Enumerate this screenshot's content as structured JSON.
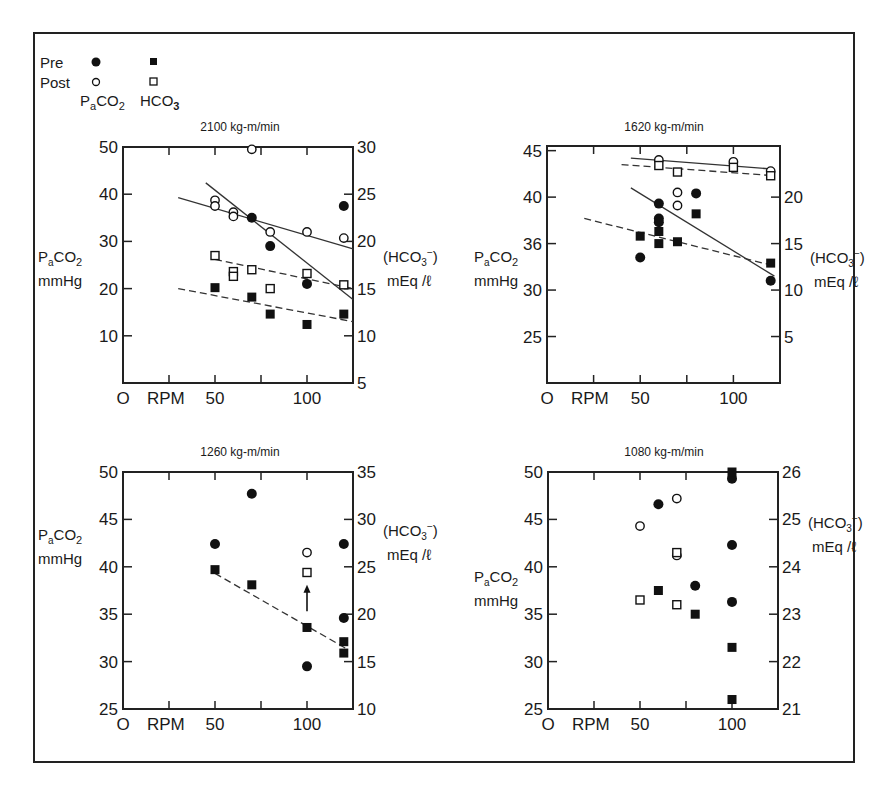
{
  "legend": {
    "rows": [
      {
        "label": "Pre",
        "paco2_marker": "filled-circle",
        "hco3_marker": "filled-square"
      },
      {
        "label": "Post",
        "paco2_marker": "open-circle",
        "hco3_marker": "open-square"
      }
    ],
    "paco2_label": "PaCO2",
    "hco3_label": "HCO3"
  },
  "chart_data": [
    {
      "type": "scatter",
      "title": "2100 kg-m/min",
      "xlabel": "RPM",
      "x_origin_label": "O",
      "x_ticks": [
        0,
        25,
        50,
        75,
        100
      ],
      "x_tick_labels": [
        "",
        "",
        "50",
        "",
        "100"
      ],
      "xlim": [
        0,
        125
      ],
      "ylabel_left": "PaCO2 mmHg",
      "ylim_left": [
        0,
        50
      ],
      "y_ticks_left": [
        50,
        40,
        30,
        20,
        10
      ],
      "ylabel_right": "(HCO3-) mEq/l",
      "ylim_right": [
        5,
        30
      ],
      "y_ticks_right": [
        30,
        25,
        20,
        15,
        10,
        5
      ],
      "series": [
        {
          "name": "Pre PaCO2",
          "axis": "left",
          "marker": "filled-circle",
          "points": [
            [
              70,
              35
            ],
            [
              80,
              29
            ],
            [
              100,
              21
            ],
            [
              120,
              37.5
            ]
          ]
        },
        {
          "name": "Post PaCO2",
          "axis": "left",
          "marker": "open-circle",
          "points": [
            [
              50,
              38.7
            ],
            [
              50,
              37.5
            ],
            [
              60,
              36.2
            ],
            [
              60,
              35.3
            ],
            [
              70,
              49.5
            ],
            [
              80,
              32
            ],
            [
              100,
              32
            ],
            [
              120,
              30.7
            ]
          ]
        },
        {
          "name": "Pre HCO3",
          "axis": "right",
          "marker": "filled-square",
          "points": [
            [
              50,
              15.1
            ],
            [
              70,
              14.1
            ],
            [
              80,
              12.3
            ],
            [
              100,
              11.2
            ],
            [
              120,
              12.3
            ]
          ]
        },
        {
          "name": "Post HCO3",
          "axis": "right",
          "marker": "open-square",
          "points": [
            [
              50,
              18.5
            ],
            [
              60,
              16.8
            ],
            [
              60,
              16.3
            ],
            [
              70,
              17
            ],
            [
              80,
              15
            ],
            [
              100,
              16.6
            ],
            [
              120,
              15.4
            ]
          ]
        }
      ],
      "fit_lines": [
        {
          "name": "Post PaCO2 fit",
          "axis": "left",
          "style": "solid",
          "from": [
            30,
            39.3
          ],
          "to": [
            125,
            28.4
          ]
        },
        {
          "name": "Pre PaCO2 fit",
          "axis": "left",
          "style": "solid",
          "from": [
            45,
            42.4
          ],
          "to": [
            125,
            17.7
          ]
        },
        {
          "name": "Post HCO3 fit",
          "axis": "right",
          "style": "dashed",
          "from": [
            50,
            18.1
          ],
          "to": [
            125,
            15
          ]
        },
        {
          "name": "Pre HCO3 fit",
          "axis": "right",
          "style": "dashed",
          "from": [
            30,
            15
          ],
          "to": [
            125,
            11.5
          ]
        }
      ]
    },
    {
      "type": "scatter",
      "title": "1620 kg-m/min",
      "xlabel": "RPM",
      "x_origin_label": "O",
      "x_ticks": [
        0,
        25,
        50,
        75,
        100
      ],
      "x_tick_labels": [
        "",
        "",
        "50",
        "",
        "100"
      ],
      "xlim": [
        0,
        125
      ],
      "ylabel_left": "PaCO2 mmHg",
      "ylim_left": [
        20,
        45.5
      ],
      "y_ticks_left": [
        45,
        40,
        35,
        30,
        25
      ],
      "y_tick_labels_left": [
        "45",
        "40",
        "36",
        "30",
        "25"
      ],
      "ylabel_right": "(HCO3-) mEq/l",
      "ylim_right": [
        0,
        25.5
      ],
      "y_ticks_right": [
        20,
        15,
        10,
        5
      ],
      "series": [
        {
          "name": "Pre PaCO2",
          "axis": "left",
          "marker": "filled-circle",
          "points": [
            [
              50,
              33.5
            ],
            [
              60,
              39.3
            ],
            [
              60,
              37.7
            ],
            [
              60,
              37.3
            ],
            [
              80,
              40.4
            ],
            [
              120,
              31
            ]
          ]
        },
        {
          "name": "Post PaCO2",
          "axis": "left",
          "marker": "open-circle",
          "points": [
            [
              60,
              44
            ],
            [
              70,
              40.5
            ],
            [
              70,
              39.1
            ],
            [
              100,
              43.8
            ],
            [
              120,
              42.8
            ]
          ]
        },
        {
          "name": "Pre HCO3",
          "axis": "right",
          "marker": "filled-square",
          "points": [
            [
              50,
              15.8
            ],
            [
              60,
              16.3
            ],
            [
              60,
              15
            ],
            [
              70,
              15.2
            ],
            [
              80,
              18.2
            ],
            [
              120,
              12.9
            ]
          ]
        },
        {
          "name": "Post HCO3",
          "axis": "right",
          "marker": "open-square",
          "points": [
            [
              60,
              23.4
            ],
            [
              70,
              22.7
            ],
            [
              100,
              23.2
            ],
            [
              120,
              22.3
            ]
          ]
        }
      ],
      "fit_lines": [
        {
          "name": "Post PaCO2 fit",
          "axis": "left",
          "style": "solid",
          "from": [
            45,
            44.2
          ],
          "to": [
            122,
            43
          ]
        },
        {
          "name": "Pre PaCO2 fit",
          "axis": "left",
          "style": "solid",
          "from": [
            45,
            41
          ],
          "to": [
            122,
            31.5
          ]
        },
        {
          "name": "Post HCO3 fit",
          "axis": "right",
          "style": "dashed",
          "from": [
            40,
            23.5
          ],
          "to": [
            122,
            22.3
          ]
        },
        {
          "name": "Pre HCO3 fit",
          "axis": "right",
          "style": "dashed",
          "from": [
            20,
            17.7
          ],
          "to": [
            122,
            12.6
          ]
        }
      ]
    },
    {
      "type": "scatter",
      "title": "1260 kg-m/min",
      "xlabel": "RPM",
      "x_origin_label": "O",
      "x_ticks": [
        0,
        25,
        50,
        75,
        100
      ],
      "x_tick_labels": [
        "",
        "",
        "50",
        "",
        "100"
      ],
      "xlim": [
        0,
        125
      ],
      "ylabel_left": "PaCO2 mmHg",
      "ylim_left": [
        25,
        50
      ],
      "y_ticks_left": [
        50,
        45,
        40,
        35,
        30,
        25
      ],
      "ylabel_right": "(HCO3-) mEq/l",
      "ylim_right": [
        10,
        35
      ],
      "y_ticks_right": [
        35,
        30,
        25,
        20,
        15,
        10
      ],
      "series": [
        {
          "name": "Pre PaCO2",
          "axis": "left",
          "marker": "filled-circle",
          "points": [
            [
              50,
              42.4
            ],
            [
              70,
              47.7
            ],
            [
              100,
              29.5
            ],
            [
              120,
              42.4
            ],
            [
              120,
              34.6
            ]
          ]
        },
        {
          "name": "Post PaCO2",
          "axis": "left",
          "marker": "open-circle",
          "points": [
            [
              100,
              41.5
            ]
          ]
        },
        {
          "name": "Pre HCO3",
          "axis": "right",
          "marker": "filled-square",
          "points": [
            [
              50,
              24.7
            ],
            [
              70,
              23.1
            ],
            [
              100,
              18.6
            ],
            [
              120,
              17.1
            ],
            [
              120,
              15.9
            ]
          ]
        },
        {
          "name": "Post HCO3",
          "axis": "right",
          "marker": "open-square",
          "points": [
            [
              100,
              24.4
            ]
          ]
        }
      ],
      "fit_lines": [
        {
          "name": "Pre HCO3 fit",
          "axis": "right",
          "style": "dashed",
          "from": [
            50,
            24.3
          ],
          "to": [
            122,
            16.3
          ]
        }
      ],
      "annotations": [
        {
          "type": "arrow-up",
          "x": 100,
          "axis": "right",
          "from": 20.3,
          "to": 22.8
        }
      ]
    },
    {
      "type": "scatter",
      "title": "1080 kg-m/min",
      "xlabel": "RPM",
      "x_origin_label": "O",
      "x_ticks": [
        0,
        25,
        50,
        75,
        100
      ],
      "x_tick_labels": [
        "",
        "",
        "50",
        "",
        "100"
      ],
      "xlim": [
        0,
        125
      ],
      "ylabel_left": "PaCO2 mmHg",
      "ylim_left": [
        25,
        50
      ],
      "y_ticks_left": [
        50,
        45,
        40,
        35,
        30,
        25
      ],
      "ylabel_right": "(HCO3-) mEq/l",
      "ylim_right": [
        21,
        26
      ],
      "y_ticks_right": [
        26,
        25,
        24,
        23,
        22,
        21
      ],
      "series": [
        {
          "name": "Pre PaCO2",
          "axis": "left",
          "marker": "filled-circle",
          "points": [
            [
              60,
              46.6
            ],
            [
              80,
              38
            ],
            [
              100,
              49.3
            ],
            [
              100,
              42.3
            ],
            [
              100,
              36.3
            ]
          ]
        },
        {
          "name": "Post PaCO2",
          "axis": "left",
          "marker": "open-circle",
          "points": [
            [
              50,
              44.3
            ],
            [
              70,
              47.2
            ],
            [
              70,
              41.2
            ]
          ]
        },
        {
          "name": "Pre HCO3",
          "axis": "right",
          "marker": "filled-square",
          "points": [
            [
              60,
              23.5
            ],
            [
              80,
              23
            ],
            [
              100,
              26
            ],
            [
              100,
              22.3
            ],
            [
              100,
              21.2
            ]
          ]
        },
        {
          "name": "Post HCO3",
          "axis": "right",
          "marker": "open-square",
          "points": [
            [
              50,
              23.3
            ],
            [
              70,
              24.3
            ],
            [
              70,
              23.2
            ]
          ]
        }
      ],
      "fit_lines": []
    }
  ]
}
